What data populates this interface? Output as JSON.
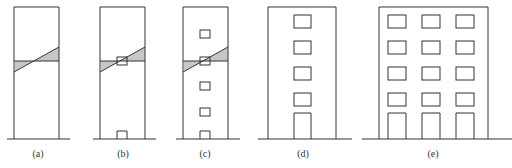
{
  "figure": {
    "panels": [
      {
        "id": "a",
        "label": "(a)",
        "label_x": 38,
        "building": {
          "x": 14,
          "y": 7,
          "w": 45,
          "h": 132
        },
        "ground": {
          "x1": 7,
          "x2": 70
        },
        "hatch": {
          "x1": 14,
          "x2": 59,
          "yh": 61,
          "yd1": 72,
          "yd2": 47
        },
        "windows": [],
        "doors": []
      },
      {
        "id": "b",
        "label": "(b)",
        "label_x": 123,
        "building": {
          "x": 100,
          "y": 7,
          "w": 45,
          "h": 132
        },
        "ground": {
          "x1": 93,
          "x2": 156
        },
        "hatch": {
          "x1": 100,
          "x2": 145,
          "yh": 61,
          "yd1": 72,
          "yd2": 47
        },
        "windows": [
          {
            "x": 117,
            "y": 57,
            "w": 10,
            "h": 8
          }
        ],
        "doors": [
          {
            "x": 117,
            "y": 131,
            "w": 10,
            "h": 8
          }
        ]
      },
      {
        "id": "c",
        "label": "(c)",
        "label_x": 205,
        "building": {
          "x": 183,
          "y": 7,
          "w": 45,
          "h": 132
        },
        "ground": {
          "x1": 176,
          "x2": 240
        },
        "hatch": {
          "x1": 183,
          "x2": 228,
          "yh": 61,
          "yd1": 72,
          "yd2": 47
        },
        "windows": [
          {
            "x": 200,
            "y": 30,
            "w": 10,
            "h": 8
          },
          {
            "x": 200,
            "y": 57,
            "w": 10,
            "h": 8
          },
          {
            "x": 200,
            "y": 82,
            "w": 10,
            "h": 8
          },
          {
            "x": 200,
            "y": 108,
            "w": 10,
            "h": 8
          }
        ],
        "doors": [
          {
            "x": 200,
            "y": 131,
            "w": 10,
            "h": 8
          }
        ]
      },
      {
        "id": "d",
        "label": "(d)",
        "label_x": 303,
        "building": {
          "x": 268,
          "y": 7,
          "w": 68,
          "h": 132
        },
        "ground": {
          "x1": 258,
          "x2": 352
        },
        "hatch": null,
        "windows": [
          {
            "x": 294,
            "y": 15,
            "w": 17,
            "h": 13
          },
          {
            "x": 294,
            "y": 41,
            "w": 17,
            "h": 13
          },
          {
            "x": 294,
            "y": 67,
            "w": 17,
            "h": 13
          },
          {
            "x": 294,
            "y": 93,
            "w": 17,
            "h": 13
          }
        ],
        "doors": [
          {
            "x": 294,
            "y": 113,
            "w": 17,
            "h": 26
          }
        ]
      },
      {
        "id": "e",
        "label": "(e)",
        "label_x": 433,
        "building": {
          "x": 379,
          "y": 7,
          "w": 109,
          "h": 132
        },
        "ground": {
          "x1": 362,
          "x2": 512
        },
        "hatch": null,
        "windows": [
          {
            "x": 388,
            "y": 15,
            "w": 18,
            "h": 13
          },
          {
            "x": 422,
            "y": 15,
            "w": 18,
            "h": 13
          },
          {
            "x": 456,
            "y": 15,
            "w": 18,
            "h": 13
          },
          {
            "x": 388,
            "y": 41,
            "w": 18,
            "h": 13
          },
          {
            "x": 422,
            "y": 41,
            "w": 18,
            "h": 13
          },
          {
            "x": 456,
            "y": 41,
            "w": 18,
            "h": 13
          },
          {
            "x": 388,
            "y": 67,
            "w": 18,
            "h": 13
          },
          {
            "x": 422,
            "y": 67,
            "w": 18,
            "h": 13
          },
          {
            "x": 456,
            "y": 67,
            "w": 18,
            "h": 13
          },
          {
            "x": 388,
            "y": 93,
            "w": 18,
            "h": 13
          },
          {
            "x": 422,
            "y": 93,
            "w": 18,
            "h": 13
          },
          {
            "x": 456,
            "y": 93,
            "w": 18,
            "h": 13
          }
        ],
        "doors": [
          {
            "x": 388,
            "y": 113,
            "w": 18,
            "h": 26
          },
          {
            "x": 422,
            "y": 113,
            "w": 18,
            "h": 26
          },
          {
            "x": 456,
            "y": 113,
            "w": 18,
            "h": 26
          }
        ]
      }
    ],
    "ground_y": 139,
    "label_y": 157,
    "colors": {
      "line": "#333333",
      "background": "#ffffff"
    }
  }
}
